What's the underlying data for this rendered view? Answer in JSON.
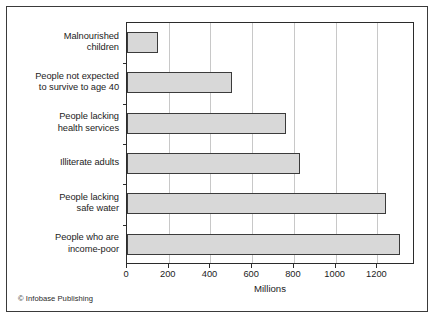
{
  "credit": "© Infobase Publishing",
  "chart_data": {
    "type": "bar",
    "orientation": "horizontal",
    "title": "",
    "xlabel": "Millions",
    "ylabel": "",
    "xlim": [
      0,
      1380
    ],
    "xticks": [
      0,
      200,
      400,
      600,
      800,
      1000,
      1200
    ],
    "xtick_labels": [
      "0",
      "200",
      "400",
      "600",
      "800",
      "1000",
      "1200"
    ],
    "grid": "vertical",
    "legend": "none",
    "bar_fill_color": "#d8d8d8",
    "bar_edge_color": "#3b3b3b",
    "categories": [
      "Malnourished children",
      "People not expected to survive to age 40",
      "People lacking health services",
      "Illiterate adults",
      "People lacking safe water",
      "People who are income-poor"
    ],
    "category_lines": [
      [
        "Malnourished",
        "children"
      ],
      [
        "People not expected",
        "to survive to age 40"
      ],
      [
        "People lacking",
        "health services"
      ],
      [
        "Illiterate adults"
      ],
      [
        "People lacking",
        "safe water"
      ],
      [
        "People who are",
        "income-poor"
      ]
    ],
    "values": [
      150,
      505,
      760,
      830,
      1240,
      1310
    ]
  }
}
